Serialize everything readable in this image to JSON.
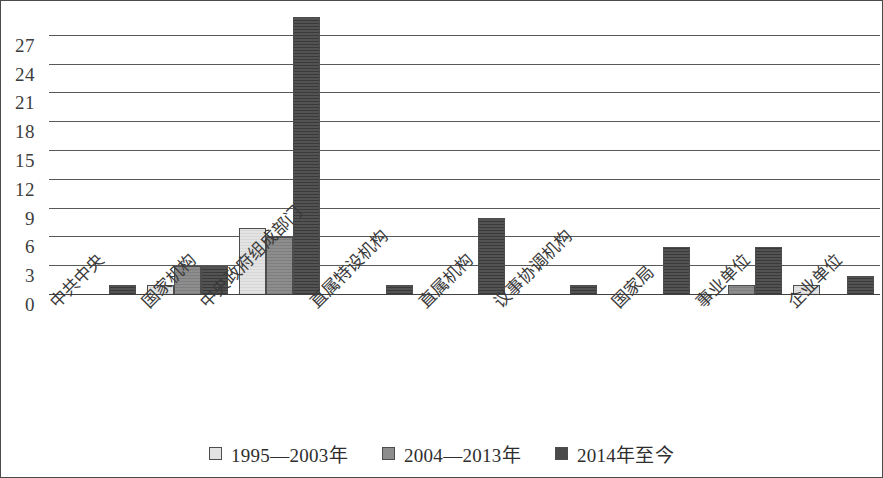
{
  "chart_data": {
    "type": "bar",
    "title": "",
    "subtitle": "",
    "xlabel": "",
    "ylabel": "",
    "ylim": [
      0,
      30
    ],
    "yticks": [
      0,
      3,
      6,
      9,
      12,
      15,
      18,
      21,
      24,
      27
    ],
    "grid": true,
    "legend_position": "bottom",
    "categories": [
      "中共中央",
      "国家机构",
      "中央政府组成部门",
      "直属特设机构",
      "直属机构",
      "议事协调机构",
      "国家局",
      "事业单位",
      "企业单位"
    ],
    "series": [
      {
        "name": "1995—2003年",
        "color": "#e3e3e3",
        "values": [
          0,
          1,
          7,
          0,
          0,
          0,
          0,
          0,
          1
        ]
      },
      {
        "name": "2004—2013年",
        "color": "#8d8d8d",
        "values": [
          0,
          3,
          6,
          0,
          0,
          0,
          0,
          1,
          0
        ]
      },
      {
        "name": "2014年至今",
        "color": "#4a4a4a",
        "values": [
          1,
          3,
          29,
          1,
          8,
          1,
          5,
          5,
          2
        ]
      }
    ]
  },
  "axis": {
    "y_tick_labels": [
      "27",
      "24",
      "21",
      "18",
      "15",
      "12",
      "9",
      "6",
      "3",
      "0"
    ]
  },
  "legend": {
    "items": [
      {
        "label": "1995—2003年",
        "swatch": "light-gray-square"
      },
      {
        "label": "2004—2013年",
        "swatch": "medium-gray-square"
      },
      {
        "label": "2014年至今",
        "swatch": "dark-gray-square"
      }
    ]
  }
}
